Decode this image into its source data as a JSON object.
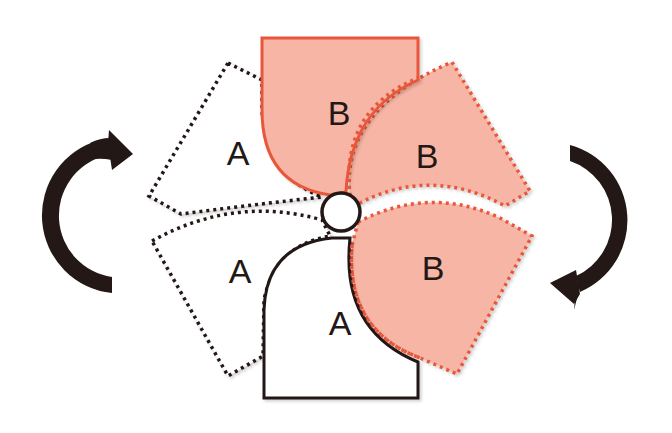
{
  "diagram": {
    "colors": {
      "background": "#ffffff",
      "piece_b_fill": "#F6B5A5",
      "piece_b_stroke": "#E8573A",
      "piece_a_fill": "#ffffff",
      "piece_a_stroke": "#231815",
      "arrow": "#231815"
    },
    "pieces": {
      "solid_b": {
        "label": "B",
        "style": "solid"
      },
      "solid_a": {
        "label": "A",
        "style": "solid"
      },
      "dashed_a_upper": {
        "label": "A",
        "style": "dashed"
      },
      "dashed_a_lower": {
        "label": "A",
        "style": "dashed"
      },
      "dashed_b_upper": {
        "label": "B",
        "style": "dashed"
      },
      "dashed_b_lower": {
        "label": "B",
        "style": "dashed"
      }
    },
    "pivot": {
      "shape": "circle"
    },
    "arrows": {
      "left": {
        "direction": "clockwise"
      },
      "right": {
        "direction": "clockwise"
      }
    }
  }
}
